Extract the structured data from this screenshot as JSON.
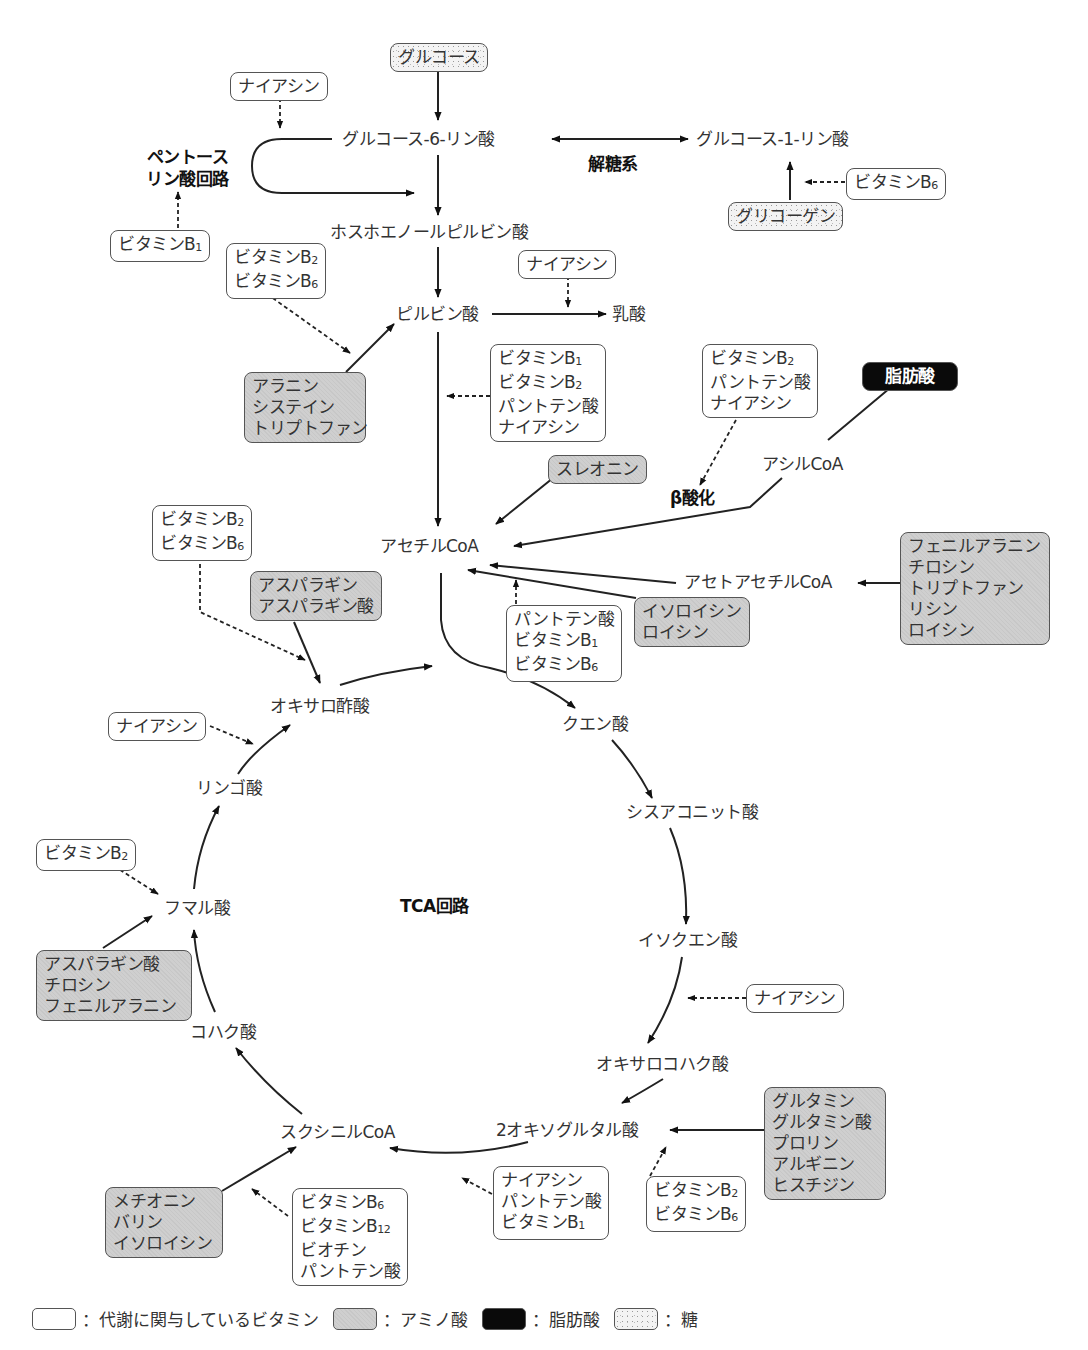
{
  "diagram": {
    "type": "metabolic-pathway",
    "title_labels": {
      "glycolysis": "解糖系",
      "pentose_phosphate": [
        "ペントース",
        "リン酸回路"
      ],
      "beta_oxidation": "β酸化",
      "tca_cycle": "TCA回路"
    },
    "metabolites": {
      "glucose6p": "グルコース-6-リン酸",
      "glucose1p": "グルコース-1-リン酸",
      "pep": "ホスホエノールピルビン酸",
      "pyruvate": "ピルビン酸",
      "lactate": "乳酸",
      "acyl_coa": "アシルCoA",
      "acetyl_coa": "アセチルCoA",
      "acetoacetyl_coa": "アセトアセチルCoA",
      "oxaloacetate": "オキサロ酢酸",
      "citrate": "クエン酸",
      "cis_aconitate": "シスアコニット酸",
      "isocitrate": "イソクエン酸",
      "oxalosuccinate": "オキサロコハク酸",
      "alpha_kg": "2オキソグルタル酸",
      "succinyl_coa": "スクシニルCoA",
      "succinate": "コハク酸",
      "fumarate": "フマル酸",
      "malate": "リンゴ酸"
    },
    "sugar_boxes": {
      "glucose": "グルコース",
      "glycogen": "グリコーゲン"
    },
    "fat_boxes": {
      "fatty_acid": "脂肪酸"
    },
    "vitamin_boxes": {
      "niacin_top": [
        "ナイアシン"
      ],
      "b1_pentose": [
        [
          "ビタミンB",
          "1"
        ]
      ],
      "b6_glycogen": [
        [
          "ビタミンB",
          "6"
        ]
      ],
      "b2b6_pyruvate": [
        [
          "ビタミンB",
          "2"
        ],
        [
          "ビタミンB",
          "6"
        ]
      ],
      "niacin_lactate": [
        "ナイアシン"
      ],
      "pdh": [
        [
          "ビタミンB",
          "1"
        ],
        [
          "ビタミンB",
          "2"
        ],
        [
          "パントテン酸",
          ""
        ],
        [
          "ナイアシン",
          ""
        ]
      ],
      "beta_ox": [
        [
          "ビタミンB",
          "2"
        ],
        [
          "パントテン酸",
          ""
        ],
        [
          "ナイアシン",
          ""
        ]
      ],
      "b2b6_oaa": [
        [
          "ビタミンB",
          "2"
        ],
        [
          "ビタミンB",
          "6"
        ]
      ],
      "acetyl_leu": [
        [
          "パントテン酸",
          ""
        ],
        [
          "ビタミンB",
          "1"
        ],
        [
          "ビタミンB",
          "6"
        ]
      ],
      "niacin_malate": [
        "ナイアシン"
      ],
      "b2_fumarate": [
        [
          "ビタミンB",
          "2"
        ]
      ],
      "niacin_isocitrate": [
        "ナイアシン"
      ],
      "akg_dh": [
        [
          "ナイアシン",
          ""
        ],
        [
          "パントテン酸",
          ""
        ],
        [
          "ビタミンB",
          "1"
        ]
      ],
      "b2b6_glu": [
        [
          "ビタミンB",
          "2"
        ],
        [
          "ビタミンB",
          "6"
        ]
      ],
      "succ_coa": [
        [
          "ビタミンB",
          "6"
        ],
        [
          "ビタミンB",
          "12"
        ],
        [
          "ビオチン",
          ""
        ],
        [
          "パントテン酸",
          ""
        ]
      ]
    },
    "amino_boxes": {
      "ala_cys_trp": [
        "アラニン",
        "システイン",
        "トリプトファン"
      ],
      "thr": [
        "スレオニン"
      ],
      "asn_asp": [
        "アスパラギン",
        "アスパラギン酸"
      ],
      "ile_leu": [
        "イソロイシン",
        "ロイシン"
      ],
      "phe_tyr_trp_lys_leu": [
        "フェニルアラニン",
        "チロシン",
        "トリプトファン",
        "リシン",
        "ロイシン"
      ],
      "asp_tyr_phe": [
        "アスパラギン酸",
        "チロシン",
        "フェニルアラニン"
      ],
      "glu_group": [
        "グルタミン",
        "グルタミン酸",
        "プロリン",
        "アルギニン",
        "ヒスチジン"
      ],
      "met_val_ile": [
        "メチオニン",
        "バリン",
        "イソロイシン"
      ]
    },
    "legend": [
      {
        "swatch": "vitamin",
        "label": "：代謝に関与しているビタミン"
      },
      {
        "swatch": "amino",
        "label": "：アミノ酸"
      },
      {
        "swatch": "fat",
        "label": "：脂肪酸"
      },
      {
        "swatch": "sugar",
        "label": "：糖"
      }
    ],
    "colors": {
      "vitamin_fill": "#ffffff",
      "amino_fill": "#cfcfcf",
      "fat_fill": "#0a0a0a",
      "sugar_fill": "#f3f3f3",
      "line": "#222222"
    }
  }
}
